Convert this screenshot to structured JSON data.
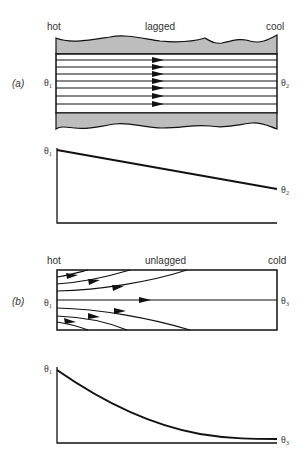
{
  "panel_a": {
    "label": "(a)",
    "left_label": "hot",
    "center_label": "lagged",
    "right_label": "cool",
    "left_temp": "θ₁",
    "right_temp": "θ₂",
    "graph": {
      "y_start_label": "θ₁",
      "y_end_label": "θ₂",
      "shape": "linear"
    }
  },
  "panel_b": {
    "label": "(b)",
    "left_label": "hot",
    "center_label": "unlagged",
    "right_label": "cold",
    "left_temp": "θ₁",
    "right_temp": "θ₃",
    "graph": {
      "y_start_label": "θ₁",
      "y_end_label": "θ₃",
      "shape": "exponential decay"
    }
  },
  "colors": {
    "lagging": "#bdbdbd",
    "line": "#111111"
  }
}
